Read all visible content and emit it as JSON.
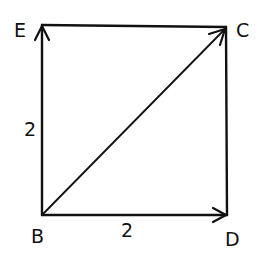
{
  "diagram": {
    "type": "vector-square",
    "colors": {
      "stroke": "#111111",
      "background": "#ffffff"
    },
    "points": {
      "E": {
        "label": "E",
        "x": 42,
        "y": 25
      },
      "C": {
        "label": "C",
        "x": 226,
        "y": 27
      },
      "B": {
        "label": "B",
        "x": 42,
        "y": 215
      },
      "D": {
        "label": "D",
        "x": 227,
        "y": 215
      }
    },
    "edges": [
      {
        "from": "B",
        "to": "E",
        "arrow": true,
        "length_label": "2"
      },
      {
        "from": "E",
        "to": "C",
        "arrow": false
      },
      {
        "from": "C",
        "to": "D",
        "arrow": false
      },
      {
        "from": "B",
        "to": "D",
        "arrow": true,
        "length_label": "2"
      },
      {
        "from": "B",
        "to": "C",
        "arrow": true
      }
    ],
    "length_labels": {
      "left_side": "2",
      "bottom_side": "2"
    }
  }
}
